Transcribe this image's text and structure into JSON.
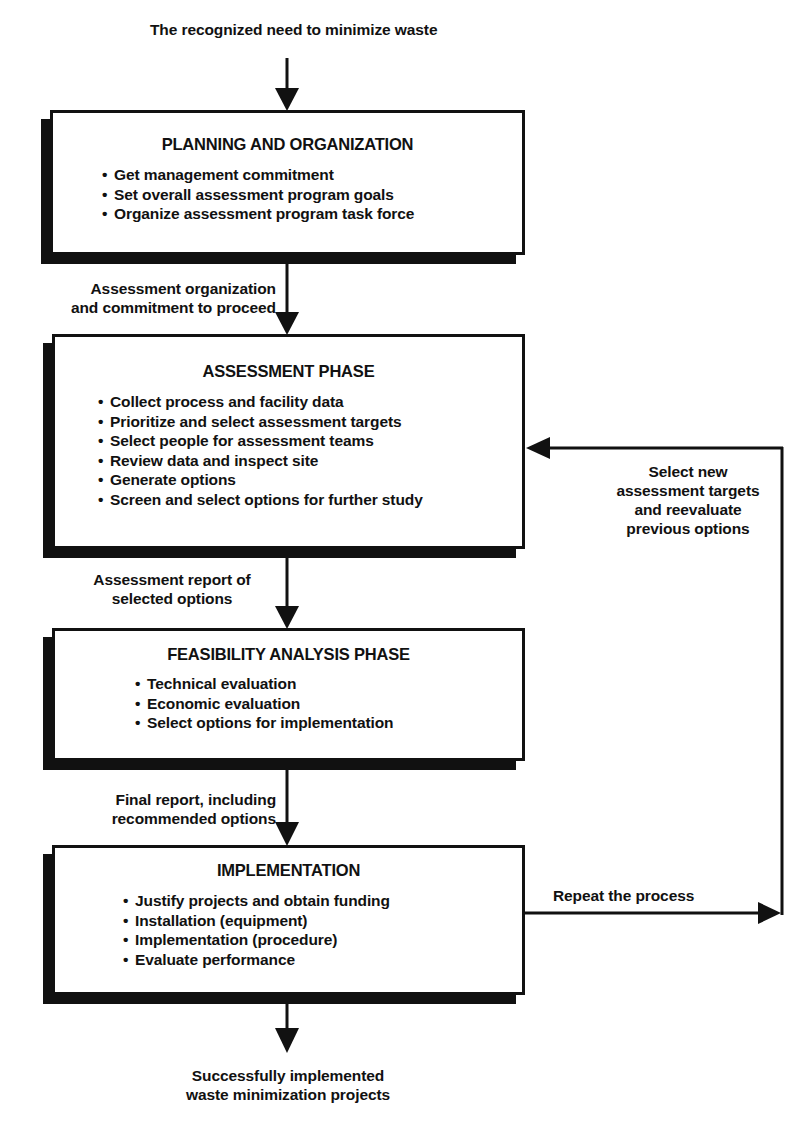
{
  "start_label": "The recognized need to minimize waste",
  "end_label": [
    "Successfully implemented",
    "waste minimization projects"
  ],
  "phases": [
    {
      "title": "PLANNING AND ORGANIZATION",
      "items": [
        "Get management commitment",
        "Set overall assessment program goals",
        "Organize assessment program task force"
      ]
    },
    {
      "title": "ASSESSMENT PHASE",
      "items": [
        "Collect process and facility data",
        "Prioritize and select assessment targets",
        "Select people for assessment teams",
        "Review data and inspect site",
        "Generate options",
        "Screen and select options for further study"
      ]
    },
    {
      "title": "FEASIBILITY ANALYSIS PHASE",
      "items": [
        "Technical evaluation",
        "Economic evaluation",
        "Select options for implementation"
      ]
    },
    {
      "title": "IMPLEMENTATION",
      "items": [
        "Justify projects and obtain funding",
        "Installation (equipment)",
        "Implementation (procedure)",
        "Evaluate performance"
      ]
    }
  ],
  "connectors": {
    "planning_to_assessment": [
      "Assessment organization",
      "and commitment to proceed"
    ],
    "assessment_to_feasibility": [
      "Assessment report of",
      "selected options"
    ],
    "feasibility_to_implementation": [
      "Final report, including",
      "recommended options"
    ],
    "repeat": "Repeat the process",
    "feedback": [
      "Select new",
      "assessment targets",
      "and reevaluate",
      "previous options"
    ]
  },
  "colors": {
    "ink": "#111111",
    "background": "#ffffff"
  }
}
